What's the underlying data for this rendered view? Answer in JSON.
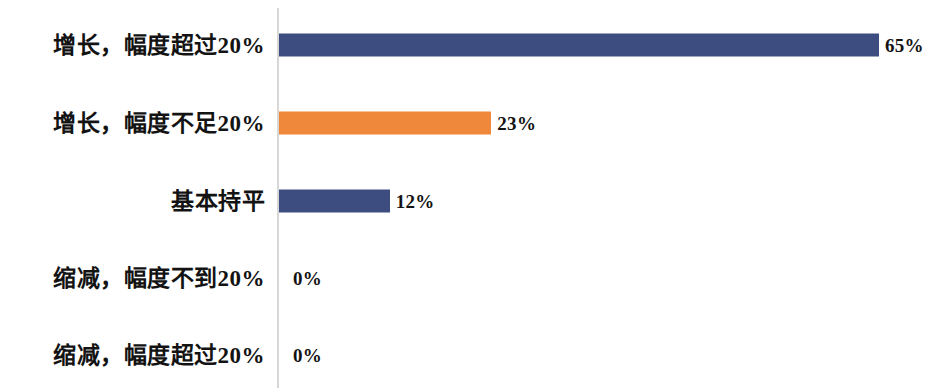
{
  "chart_data": {
    "type": "bar",
    "orientation": "horizontal",
    "title": "",
    "subtitle": "",
    "xlabel": "",
    "ylabel": "",
    "categories": [
      "增长，幅度超过20%",
      "增长，幅度不足20%",
      "基本持平",
      "缩减，幅度不到20%",
      "缩减，幅度超过20%"
    ],
    "values": [
      65,
      23,
      12,
      0,
      0
    ],
    "value_labels": [
      "65%",
      "23%",
      "12%",
      "0%",
      "0%"
    ],
    "bar_colors": [
      "#3e4d7f",
      "#f0883c",
      "#3e4d7f",
      "#3e4d7f",
      "#3e4d7f"
    ],
    "xlim": [
      0,
      70
    ],
    "grid": false,
    "legend": null,
    "axis_color": "#d7d7d7",
    "background_color": "#ffffff",
    "text_color": "#131313"
  }
}
